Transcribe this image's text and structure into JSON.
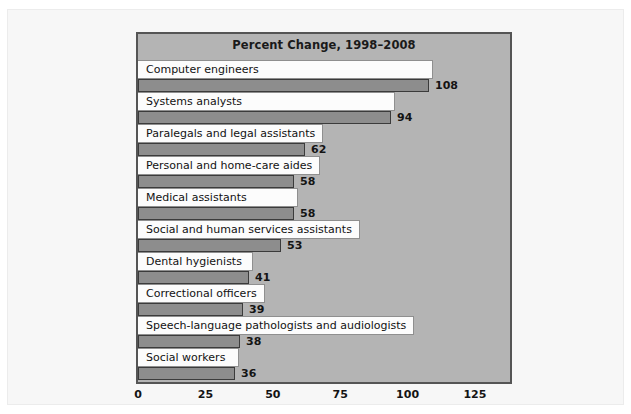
{
  "figure": {
    "title": "Percent Change, 1998–2008",
    "panel_bg": "#b4b4b4",
    "bar_color": "#8d8d8d",
    "bar_border": "#3b3b3b",
    "label_strip_bg": "#fcfcfc",
    "page_bg": "#f7f7f7"
  },
  "chart_data": {
    "type": "bar",
    "orientation": "horizontal",
    "title": "Percent Change, 1998–2008",
    "xlabel": "",
    "ylabel": "",
    "xlim": [
      0,
      138
    ],
    "xticks": [
      0,
      25,
      50,
      75,
      100,
      125
    ],
    "xtick_labels": [
      "0",
      "25",
      "50",
      "75",
      "100",
      "125"
    ],
    "grid": false,
    "legend": null,
    "categories": [
      "Computer engineers",
      "Systems analysts",
      "Paralegals and legal assistants",
      "Personal and home-care aides",
      "Medical assistants",
      "Social and human services assistants",
      "Dental hygienists",
      "Correctional officers",
      "Speech-language pathologists and audiologists",
      "Social workers"
    ],
    "values": [
      108,
      94,
      62,
      58,
      58,
      53,
      41,
      39,
      38,
      36
    ],
    "value_labels": [
      "108",
      "94",
      "62",
      "58",
      "58",
      "53",
      "41",
      "39",
      "38",
      "36"
    ]
  }
}
